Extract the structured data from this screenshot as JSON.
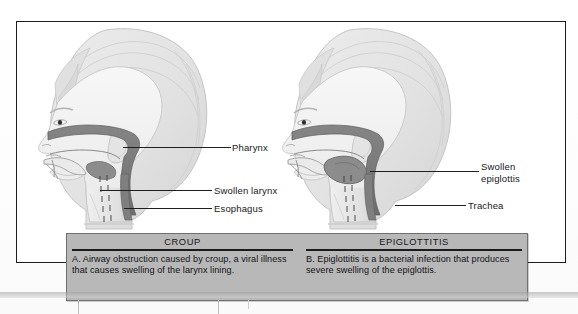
{
  "figure": {
    "title_alt": "Comparison of croup and epiglottitis airway anatomy"
  },
  "panels": [
    {
      "id": "croup",
      "side": "left",
      "labels": [
        {
          "name": "pharynx",
          "text": "Pharynx"
        },
        {
          "name": "swollen-larynx",
          "text": "Swollen larynx"
        },
        {
          "name": "esophagus",
          "text": "Esophagus"
        }
      ]
    },
    {
      "id": "epiglottitis",
      "side": "right",
      "labels": [
        {
          "name": "swollen-epiglottis",
          "line1": "Swollen",
          "line2": "epiglottis"
        },
        {
          "name": "trachea",
          "text": "Trachea"
        }
      ]
    }
  ],
  "caption": {
    "columns": [
      {
        "heading": "CROUP",
        "body": "A.  Airway obstruction caused by croup, a viral illness that causes swelling of the larynx lining."
      },
      {
        "heading": "EPIGLOTTITIS",
        "body": "B.  Epiglottitis is a bacterial infection that produces severe swelling of the epiglottis."
      }
    ]
  },
  "colors": {
    "frame": "#1c1c1c",
    "caption_bg": "#b8b8b8",
    "airway_dark": "#7a7a7a",
    "skin": "#f2f2f2",
    "hair": "#e6e6e6",
    "label_text": "#18181a"
  }
}
